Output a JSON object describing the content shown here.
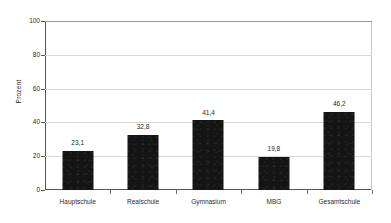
{
  "chart_data": {
    "type": "bar",
    "title": "",
    "xlabel": "",
    "ylabel": "Prozent",
    "ylim": [
      0,
      100
    ],
    "yticks": [
      0,
      20,
      40,
      60,
      80,
      100
    ],
    "ytick_labels": [
      "0",
      "20",
      "40",
      "60",
      "80",
      "100"
    ],
    "grid": true,
    "legend": "none",
    "decimal_separator": ",",
    "bar_color": "#141414",
    "gridline_color": "#d8d8d8",
    "axis_color": "#555555",
    "background_color": "#ffffff",
    "categories": [
      "Hauptschule",
      "Realschule",
      "Gymnasium",
      "MBG",
      "Gesamtschule"
    ],
    "values": [
      23.1,
      32.8,
      41.4,
      19.8,
      46.2
    ],
    "value_labels": [
      "23,1",
      "32,8",
      "41,4",
      "19,8",
      "46,2"
    ]
  }
}
